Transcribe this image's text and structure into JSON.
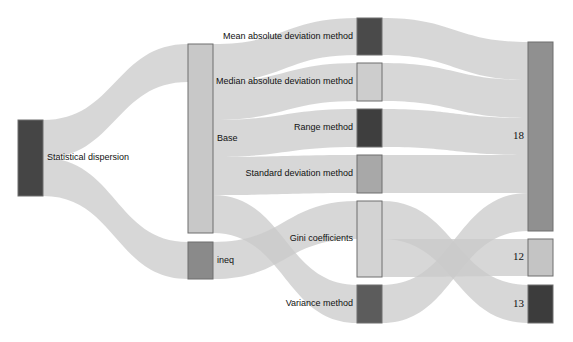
{
  "chart_data": {
    "type": "sankey",
    "title": "",
    "nodes": [
      {
        "id": "stat",
        "label": "Statistical dispersion",
        "color": "#454545",
        "x": 18,
        "y0": 120,
        "y1": 196,
        "label_side": "right"
      },
      {
        "id": "base",
        "label": "Base",
        "color": "#c8c8c8",
        "x": 188,
        "y0": 44,
        "y1": 233,
        "label_side": "right"
      },
      {
        "id": "ineq",
        "label": "ineq",
        "color": "#8a8a8a",
        "x": 188,
        "y0": 242,
        "y1": 279,
        "label_side": "right"
      },
      {
        "id": "mean",
        "label": "Mean absolute deviation method",
        "color": "#4a4a4a",
        "x": 357,
        "y0": 18,
        "y1": 55,
        "label_side": "left"
      },
      {
        "id": "median",
        "label": "Median absolute deviation method",
        "color": "#cdcdcd",
        "x": 357,
        "y0": 63,
        "y1": 101,
        "label_side": "left"
      },
      {
        "id": "range",
        "label": "Range method",
        "color": "#3e3e3e",
        "x": 357,
        "y0": 109,
        "y1": 147,
        "label_side": "left"
      },
      {
        "id": "std",
        "label": "Standard deviation method",
        "color": "#a8a8a8",
        "x": 357,
        "y0": 155,
        "y1": 193,
        "label_side": "left"
      },
      {
        "id": "gini",
        "label": "Gini coefficients",
        "color": "#d3d3d3",
        "x": 357,
        "y0": 201,
        "y1": 277,
        "label_side": "left"
      },
      {
        "id": "var",
        "label": "Variance method",
        "color": "#5c5c5c",
        "x": 357,
        "y0": 285,
        "y1": 323,
        "label_side": "left"
      },
      {
        "id": "n18",
        "label": "18",
        "color": "#909090",
        "x": 528,
        "y0": 42,
        "y1": 231,
        "label_side": "left"
      },
      {
        "id": "n12",
        "label": "12",
        "color": "#c4c4c4",
        "x": 528,
        "y0": 239,
        "y1": 276,
        "label_side": "left"
      },
      {
        "id": "n13",
        "label": "13",
        "color": "#3c3c3c",
        "x": 528,
        "y0": 285,
        "y1": 323,
        "label_side": "left"
      }
    ],
    "links": [
      {
        "source": "stat",
        "target": "base",
        "value": 5,
        "sy0": 120,
        "sy1": 158,
        "ty0": 44,
        "ty1": 82
      },
      {
        "source": "stat",
        "target": "ineq",
        "value": 1,
        "sy0": 158,
        "sy1": 196,
        "ty0": 242,
        "ty1": 279
      },
      {
        "source": "base",
        "target": "mean",
        "value": 1,
        "sy0": 44,
        "sy1": 82,
        "ty0": 18,
        "ty1": 55
      },
      {
        "source": "base",
        "target": "median",
        "value": 1,
        "sy0": 82,
        "sy1": 120,
        "ty0": 63,
        "ty1": 101
      },
      {
        "source": "base",
        "target": "range",
        "value": 1,
        "sy0": 120,
        "sy1": 157,
        "ty0": 109,
        "ty1": 147
      },
      {
        "source": "base",
        "target": "std",
        "value": 1,
        "sy0": 157,
        "sy1": 195,
        "ty0": 155,
        "ty1": 193
      },
      {
        "source": "base",
        "target": "var",
        "value": 1,
        "sy0": 195,
        "sy1": 233,
        "ty0": 285,
        "ty1": 323
      },
      {
        "source": "ineq",
        "target": "gini",
        "value": 1,
        "sy0": 242,
        "sy1": 279,
        "ty0": 201,
        "ty1": 239
      },
      {
        "source": "mean",
        "target": "n18",
        "value": 1,
        "sy0": 18,
        "sy1": 55,
        "ty0": 42,
        "ty1": 80
      },
      {
        "source": "median",
        "target": "n18",
        "value": 1,
        "sy0": 63,
        "sy1": 101,
        "ty0": 80,
        "ty1": 118
      },
      {
        "source": "range",
        "target": "n18",
        "value": 1,
        "sy0": 109,
        "sy1": 147,
        "ty0": 118,
        "ty1": 155
      },
      {
        "source": "std",
        "target": "n18",
        "value": 1,
        "sy0": 155,
        "sy1": 193,
        "ty0": 155,
        "ty1": 193
      },
      {
        "source": "var",
        "target": "n18",
        "value": 1,
        "sy0": 285,
        "sy1": 323,
        "ty0": 193,
        "ty1": 231
      },
      {
        "source": "gini",
        "target": "n13",
        "value": 1,
        "sy0": 201,
        "sy1": 239,
        "ty0": 285,
        "ty1": 323
      },
      {
        "source": "gini",
        "target": "n12",
        "value": 1,
        "sy0": 239,
        "sy1": 277,
        "ty0": 239,
        "ty1": 276
      }
    ],
    "node_width": 25,
    "link_color": "#c9c9c9"
  }
}
